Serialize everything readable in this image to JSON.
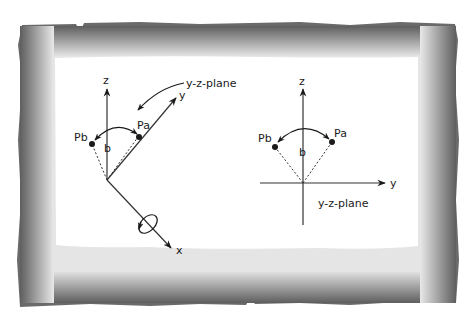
{
  "frame": {
    "style": "torn-paper gradient border",
    "outer_color": "#5a5a5a",
    "inner_color": "#e6e6e6",
    "paper_color": "#ffffff"
  },
  "left_diagram": {
    "axes": {
      "z": "z",
      "y": "y",
      "x": "x"
    },
    "plane_label": "y-z-plane",
    "point_a": "Pa",
    "point_b": "Pb",
    "angle_label": "b",
    "rotation_marker": "ellipse rotation arrow around x-axis"
  },
  "right_diagram": {
    "axes": {
      "z": "z",
      "y": "y"
    },
    "plane_label": "y-z-plane",
    "point_a": "Pa",
    "point_b": "Pb",
    "angle_label": "b"
  },
  "colors": {
    "ink": "#1a1a1a",
    "axis": "#333333"
  }
}
